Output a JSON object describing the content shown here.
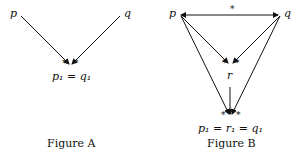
{
  "figure_a": {
    "caption": "Figure A",
    "nodes": {
      "p": "p",
      "q": "q",
      "meet": "p₁ = q₁"
    },
    "edges": [
      {
        "from": "p",
        "to": "p1=q1",
        "marked": true
      },
      {
        "from": "q",
        "to": "p1=q1",
        "marked": true
      }
    ],
    "marks": [
      "*",
      "*"
    ]
  },
  "figure_b": {
    "caption": "Figure B",
    "nodes": {
      "p": "p",
      "q": "q",
      "r": "r",
      "bottom": "p₁ = r₁ = q₁"
    },
    "edges": [
      {
        "from": "p",
        "to": "q",
        "bidirectional": true,
        "label": "*"
      },
      {
        "from": "p",
        "to": "r",
        "marked": true
      },
      {
        "from": "q",
        "to": "r",
        "marked": true
      },
      {
        "from": "p",
        "to": "p1=r1=q1"
      },
      {
        "from": "q",
        "to": "p1=r1=q1"
      },
      {
        "from": "r",
        "to": "p1=r1=q1"
      }
    ],
    "top_edge_label": "*",
    "marks": [
      "*",
      "*",
      "*",
      "*"
    ]
  }
}
